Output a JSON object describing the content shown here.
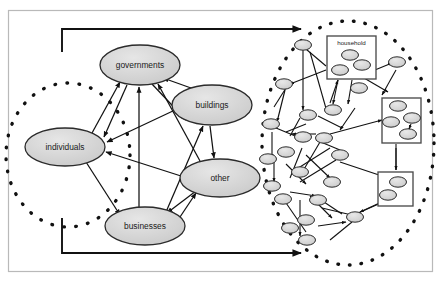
{
  "figure": {
    "kind": "node-link-diagram",
    "background": "#ffffff",
    "frame": {
      "x": 8,
      "y": 10,
      "width": 425,
      "height": 262,
      "stroke": "#b9b9b9"
    }
  },
  "style": {
    "node_fill": "#d4d4d4",
    "node_stroke": "#2b2b2b",
    "edge_color": "#111111",
    "dotted_color": "#111111",
    "box_fill": "#ffffff",
    "box_stroke": "#4a4a4a",
    "label_color": "#1a1a1a"
  },
  "left_cluster": {
    "name": "aggregate-actor-graph",
    "boundary": {
      "shape": "dotted-ellipse",
      "cx": 68,
      "cy": 155,
      "rx": 62,
      "ry": 72
    },
    "nodes": [
      {
        "id": "governments",
        "label": "governments",
        "cx": 140,
        "cy": 65,
        "rx": 40,
        "ry": 20
      },
      {
        "id": "buildings",
        "label": "buildings",
        "cx": 212,
        "cy": 105,
        "rx": 40,
        "ry": 20
      },
      {
        "id": "individuals",
        "label": "individuals",
        "cx": 65,
        "cy": 147,
        "rx": 40,
        "ry": 19
      },
      {
        "id": "other",
        "label": "other",
        "cx": 220,
        "cy": 178,
        "rx": 40,
        "ry": 19
      },
      {
        "id": "businesses",
        "label": "businesses",
        "cx": 145,
        "cy": 226,
        "rx": 40,
        "ry": 19
      }
    ],
    "edges": [
      {
        "from": "individuals",
        "to": "governments"
      },
      {
        "from": "individuals",
        "to": "businesses"
      },
      {
        "from": "buildings",
        "to": "individuals"
      },
      {
        "from": "other",
        "to": "individuals"
      },
      {
        "from": "businesses",
        "to": "governments"
      },
      {
        "from": "businesses",
        "to": "buildings"
      },
      {
        "from": "businesses",
        "to": "other"
      },
      {
        "from": "buildings",
        "to": "governments"
      },
      {
        "from": "other",
        "to": "governments"
      },
      {
        "from": "governments",
        "to": "buildings"
      },
      {
        "from": "buildings",
        "to": "other"
      },
      {
        "from": "other",
        "to": "businesses"
      },
      {
        "from": "governments",
        "to": "businesses"
      }
    ]
  },
  "right_cluster": {
    "name": "disaggregate-agent-graph",
    "boundary": {
      "shape": "dotted-ellipse",
      "cx": 348,
      "cy": 143,
      "rx": 86,
      "ry": 122
    },
    "boxes": [
      {
        "id": "household",
        "label": "household",
        "x": 327,
        "y": 36,
        "width": 49,
        "height": 43,
        "node_count": 3
      },
      {
        "id": "box2",
        "label": "",
        "x": 382,
        "y": 98,
        "width": 39,
        "height": 45,
        "node_count": 4
      },
      {
        "id": "box3",
        "label": "",
        "x": 378,
        "y": 172,
        "width": 35,
        "height": 34,
        "node_count": 2
      }
    ],
    "agent_node_count": 24,
    "agent_node_size": {
      "rx": 8.5,
      "ry": 5.2
    }
  },
  "macro_links": [
    {
      "name": "left-to-right-top-link",
      "label": "",
      "path": "M62,52 L62,29 L301,29",
      "arrow": "end"
    },
    {
      "name": "left-to-right-bottom-link",
      "label": "",
      "path": "M62,218 L62,253 L301,253",
      "arrow": "end"
    }
  ]
}
